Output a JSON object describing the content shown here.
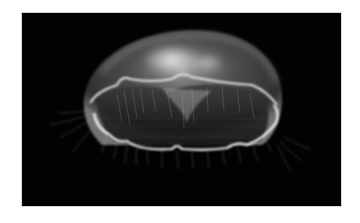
{
  "image": {
    "subject": "moon jellyfish",
    "alt": "Moon jellyfish glowing against a black background",
    "colors": {
      "background": "#020202",
      "page": "#ffffff",
      "bell_glow": "#e8e8e8",
      "rim": "#f2f2f2"
    }
  }
}
